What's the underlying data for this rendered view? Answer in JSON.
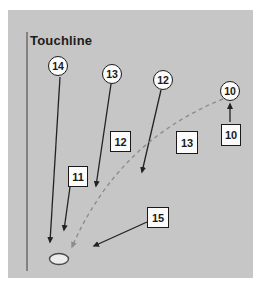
{
  "diagram": {
    "touchline_label": "Touchline",
    "player_circles": [
      {
        "label": "14"
      },
      {
        "label": "13"
      },
      {
        "label": "12"
      },
      {
        "label": "10"
      }
    ],
    "position_boxes": [
      {
        "label": "12"
      },
      {
        "label": "13"
      },
      {
        "label": "10"
      },
      {
        "label": "11"
      },
      {
        "label": "15"
      }
    ],
    "colors": {
      "panel_bg": "#c6c6c6",
      "page_bg": "#ffffff",
      "solid_line": "#222222",
      "dashed_line": "#8d8d8d",
      "shape_fill": "#fbfbfb",
      "shape_border": "#1a1a1a",
      "ball_fill": "#ececec"
    }
  }
}
